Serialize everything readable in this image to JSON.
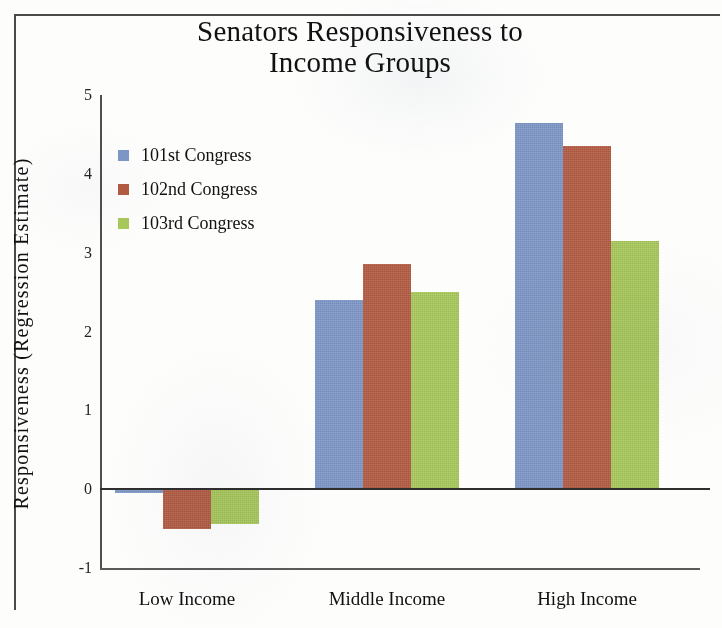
{
  "chart_data": {
    "type": "bar",
    "title": "Senators Responsiveness to Income Groups",
    "title_line1": "Senators Responsiveness to",
    "title_line2": "Income Groups",
    "xlabel": "",
    "ylabel": "Responsiveness (Regression Estimate)",
    "categories": [
      "Low Income",
      "Middle Income",
      "High Income"
    ],
    "series": [
      {
        "name": "101st Congress",
        "color": "#7d97c7",
        "values": [
          -0.05,
          2.4,
          4.65
        ]
      },
      {
        "name": "102nd Congress",
        "color": "#b45b42",
        "values": [
          -0.5,
          2.85,
          4.35
        ]
      },
      {
        "name": "103rd Congress",
        "color": "#a8c95a",
        "values": [
          -0.44,
          2.5,
          3.15
        ]
      }
    ],
    "ylim": [
      -1,
      5
    ],
    "yticks": [
      5,
      4,
      3,
      2,
      1,
      0,
      -1
    ],
    "ytick_labels": [
      "5",
      "4",
      "3",
      "2",
      "1",
      "0",
      "-1"
    ],
    "grid": false,
    "legend_position": "upper left",
    "zero_line": true
  }
}
